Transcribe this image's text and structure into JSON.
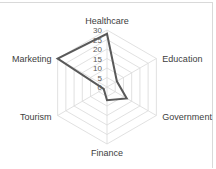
{
  "chart_data": {
    "type": "radar",
    "title": "",
    "categories": [
      "Healthcare",
      "Education",
      "Government",
      "Finance",
      "Tourism",
      "Marketing"
    ],
    "series": [
      {
        "name": "Series 1",
        "values": [
          28,
          6,
          12,
          7,
          2,
          30
        ],
        "color": "#595959"
      }
    ],
    "rlim": [
      0,
      30
    ],
    "ticks": [
      "0",
      "5",
      "10",
      "15",
      "20",
      "25",
      "30"
    ],
    "grid": true,
    "legend": "none"
  }
}
